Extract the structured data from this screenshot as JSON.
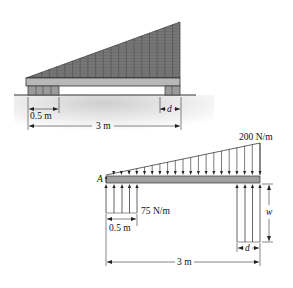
{
  "figure": {
    "top_view": {
      "description": "Stack of wood on planks resting on ground",
      "dimensions": {
        "pad_width": "0.5 m",
        "total_length": "3 m",
        "right_pad": "d"
      }
    },
    "free_body_diagram": {
      "point_label": "A",
      "distributed_load_max": "200 N/m",
      "left_reaction_load": "75 N/m",
      "right_reaction_load": "w",
      "dimensions": {
        "left_width": "0.5 m",
        "right_width": "d",
        "total_length": "3 m"
      }
    }
  },
  "colors": {
    "line": "#222222",
    "wood_fill": "#6e6e6e",
    "plank_fill": "#b8b8b8",
    "beam_fill": "#a0a0a0",
    "ground_shade": "#dcdcdc"
  }
}
